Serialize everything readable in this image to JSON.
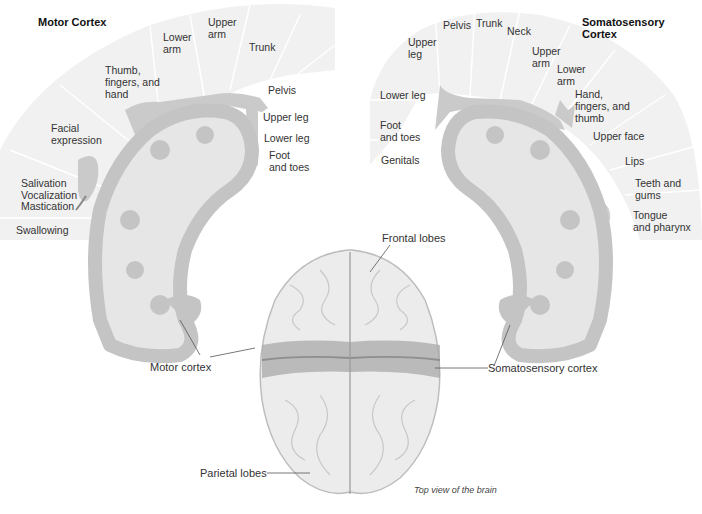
{
  "colors": {
    "fan_bg": "#f1f1f1",
    "fan_divider": "#ffffff",
    "cortex_gray": "#c4c4c4",
    "white_matter": "#e6e6e6",
    "homunculus_gray": "#cacaca",
    "brain_light": "#ececec",
    "brain_band": "#a9a9a9",
    "text": "#333333"
  },
  "motor": {
    "title": "Motor Cortex",
    "labels": [
      {
        "text": "Lower\narm",
        "lines": [
          "Lower",
          "arm"
        ]
      },
      {
        "text": "Upper\narm",
        "lines": [
          "Upper",
          "arm"
        ]
      },
      {
        "text": "Trunk",
        "lines": [
          "Trunk"
        ]
      },
      {
        "text": "Thumb,\nfingers, and\nhand",
        "lines": [
          "Thumb,",
          "fingers, and",
          "hand"
        ]
      },
      {
        "text": "Pelvis",
        "lines": [
          "Pelvis"
        ]
      },
      {
        "text": "Upper leg",
        "lines": [
          "Upper leg"
        ]
      },
      {
        "text": "Facial\nexpression",
        "lines": [
          "Facial",
          "expression"
        ]
      },
      {
        "text": "Lower leg",
        "lines": [
          "Lower leg"
        ]
      },
      {
        "text": "Foot\nand toes",
        "lines": [
          "Foot",
          "and toes"
        ]
      },
      {
        "text": "Salivation",
        "lines": [
          "Salivation"
        ]
      },
      {
        "text": "Vocalization",
        "lines": [
          "Vocalization"
        ]
      },
      {
        "text": "Mastication",
        "lines": [
          "Mastication"
        ]
      },
      {
        "text": "Swallowing",
        "lines": [
          "Swallowing"
        ]
      }
    ]
  },
  "sensory": {
    "title": "Somatosensory Cortex",
    "labels": [
      {
        "lines": [
          "Pelvis"
        ]
      },
      {
        "lines": [
          "Trunk"
        ]
      },
      {
        "lines": [
          "Neck"
        ]
      },
      {
        "lines": [
          "Upper",
          "leg"
        ]
      },
      {
        "lines": [
          "Upper",
          "arm"
        ]
      },
      {
        "lines": [
          "Lower",
          "arm"
        ]
      },
      {
        "lines": [
          "Lower leg"
        ]
      },
      {
        "lines": [
          "Hand,",
          "fingers, and",
          "thumb"
        ]
      },
      {
        "lines": [
          "Foot",
          "and toes"
        ]
      },
      {
        "lines": [
          "Upper face"
        ]
      },
      {
        "lines": [
          "Genitals"
        ]
      },
      {
        "lines": [
          "Lips"
        ]
      },
      {
        "lines": [
          "Teeth and",
          "gums"
        ]
      },
      {
        "lines": [
          "Tongue",
          "and pharynx"
        ]
      }
    ]
  },
  "callouts": {
    "frontal": "Frontal lobes",
    "motor": "Motor cortex",
    "sensory": "Somatosensory cortex",
    "parietal": "Parietal lobes"
  },
  "caption": "Top view of the brain"
}
